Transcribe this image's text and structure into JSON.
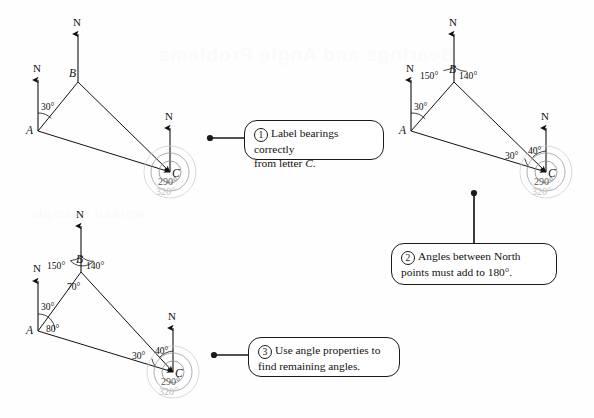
{
  "page": {
    "background": "#fefefe",
    "ghost_text_top": "Bearings and Angle Problems",
    "ghost_text_mid": "worked example"
  },
  "callouts": [
    {
      "number": "1",
      "line1": "Label bearings correctly",
      "line2_pre": "from letter ",
      "line2_italic": "C",
      "line2_post": "."
    },
    {
      "number": "2",
      "line1": "Angles between North",
      "line2_pre": "points must add to 180°.",
      "line2_italic": "",
      "line2_post": ""
    },
    {
      "number": "3",
      "line1": "Use angle properties to",
      "line2_pre": "find remaining angles.",
      "line2_italic": "",
      "line2_post": ""
    }
  ],
  "diagrams": [
    {
      "id": "diagram-1",
      "caption": "Stage 1 - bearings at C only",
      "vertices": [
        {
          "name": "A",
          "label": "A",
          "x": 38,
          "y": 131
        },
        {
          "name": "B",
          "label": "B",
          "x": 78,
          "y": 82
        },
        {
          "name": "C",
          "label": "C",
          "x": 170,
          "y": 172
        }
      ],
      "north_lines": [
        {
          "at": "A",
          "label": "N"
        },
        {
          "at": "B",
          "label": "N"
        },
        {
          "at": "C",
          "label": "N"
        }
      ],
      "angles": [
        {
          "label": "30°",
          "at": "A",
          "x": 41,
          "y": 101
        }
      ],
      "bearings": [
        {
          "label": "290°",
          "color": "#555555",
          "x": 158,
          "y": 182
        },
        {
          "label": "320°",
          "color": "#bdbdbd",
          "x": 156,
          "y": 191
        }
      ]
    },
    {
      "id": "diagram-2",
      "caption": "Stage 2 - North point angles added",
      "vertices": [
        {
          "name": "A",
          "label": "A",
          "x": 411,
          "y": 131
        },
        {
          "name": "B",
          "label": "B",
          "x": 454,
          "y": 82
        },
        {
          "name": "C",
          "label": "C",
          "x": 546,
          "y": 172
        }
      ],
      "north_lines": [
        {
          "at": "A",
          "label": "N"
        },
        {
          "at": "B",
          "label": "N"
        },
        {
          "at": "C",
          "label": "N"
        }
      ],
      "angles": [
        {
          "label": "30°",
          "at": "A",
          "x": 414,
          "y": 101
        },
        {
          "label": "150°",
          "at": "B-left",
          "x": 422,
          "y": 71
        },
        {
          "label": "140°",
          "at": "B-right",
          "x": 458,
          "y": 71
        },
        {
          "label": "30°",
          "at": "C-left",
          "x": 504,
          "y": 152
        },
        {
          "label": "40°",
          "at": "C-right",
          "x": 527,
          "y": 148
        }
      ],
      "bearings": [
        {
          "label": "290°",
          "color": "#555555",
          "x": 534,
          "y": 182
        },
        {
          "label": "320°",
          "color": "#bdbdbd",
          "x": 532,
          "y": 191
        }
      ]
    },
    {
      "id": "diagram-3",
      "caption": "Stage 3 - interior angles found",
      "vertices": [
        {
          "name": "A",
          "label": "A",
          "x": 38,
          "y": 331
        },
        {
          "name": "B",
          "label": "B",
          "x": 81,
          "y": 272
        },
        {
          "name": "C",
          "label": "C",
          "x": 173,
          "y": 372
        }
      ],
      "north_lines": [
        {
          "at": "A",
          "label": "N"
        },
        {
          "at": "B",
          "label": "N"
        },
        {
          "at": "C",
          "label": "N"
        }
      ],
      "angles": [
        {
          "label": "30°",
          "at": "A-north",
          "x": 41,
          "y": 301
        },
        {
          "label": "80°",
          "at": "A-interior",
          "x": 47,
          "y": 326
        },
        {
          "label": "150°",
          "at": "B-left",
          "x": 49,
          "y": 261
        },
        {
          "label": "140°",
          "at": "B-right",
          "x": 85,
          "y": 261
        },
        {
          "label": "70°",
          "at": "B-interior",
          "x": 68,
          "y": 283
        },
        {
          "label": "30°",
          "at": "C-left",
          "x": 131,
          "y": 352
        },
        {
          "label": "40°",
          "at": "C-right",
          "x": 154,
          "y": 348
        }
      ],
      "bearings": [
        {
          "label": "290°",
          "color": "#555555",
          "x": 161,
          "y": 382
        },
        {
          "label": "320°",
          "color": "#bdbdbd",
          "x": 159,
          "y": 391
        }
      ]
    }
  ],
  "colors": {
    "ink": "#111111",
    "bearing_dark": "#555555",
    "bearing_light": "#bdbdbd",
    "leader": "#1a1a1a"
  }
}
